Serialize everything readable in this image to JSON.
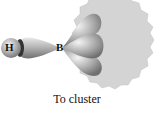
{
  "labels": {
    "hydrogen": "H",
    "boron": "B"
  },
  "caption": "To cluster",
  "colors": {
    "cluster_fill": "#d4d4d4",
    "orbital": "#bdbdbd"
  }
}
